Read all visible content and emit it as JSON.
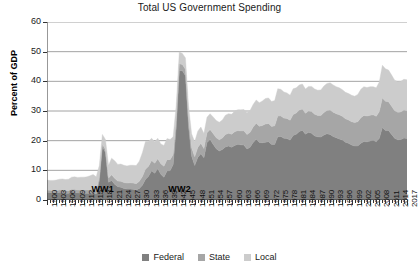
{
  "chart_data": {
    "type": "area",
    "stacked": true,
    "title": "Total US Government Spending",
    "xlabel": "",
    "ylabel": "Percent of GDP",
    "ylim": [
      0,
      60
    ],
    "yticks": [
      0,
      10,
      20,
      30,
      40,
      50,
      60
    ],
    "grid": true,
    "legend_position": "bottom",
    "x_tick_step": 3,
    "xlim": [
      1900,
      2017
    ],
    "x": [
      1900,
      1901,
      1902,
      1903,
      1904,
      1905,
      1906,
      1907,
      1908,
      1909,
      1910,
      1911,
      1912,
      1913,
      1914,
      1915,
      1916,
      1917,
      1918,
      1919,
      1920,
      1921,
      1922,
      1923,
      1924,
      1925,
      1926,
      1927,
      1928,
      1929,
      1930,
      1931,
      1932,
      1933,
      1934,
      1935,
      1936,
      1937,
      1938,
      1939,
      1940,
      1941,
      1942,
      1943,
      1944,
      1945,
      1946,
      1947,
      1948,
      1949,
      1950,
      1951,
      1952,
      1953,
      1954,
      1955,
      1956,
      1957,
      1958,
      1959,
      1960,
      1961,
      1962,
      1963,
      1964,
      1965,
      1966,
      1967,
      1968,
      1969,
      1970,
      1971,
      1972,
      1973,
      1974,
      1975,
      1976,
      1977,
      1978,
      1979,
      1980,
      1981,
      1982,
      1983,
      1984,
      1985,
      1986,
      1987,
      1988,
      1989,
      1990,
      1991,
      1992,
      1993,
      1994,
      1995,
      1996,
      1997,
      1998,
      1999,
      2000,
      2001,
      2002,
      2003,
      2004,
      2005,
      2006,
      2007,
      2008,
      2009,
      2010,
      2011,
      2012,
      2013,
      2014,
      2015,
      2016,
      2017
    ],
    "xticklabels": [
      "1900",
      "1903",
      "1906",
      "1909",
      "1912",
      "1915",
      "1918",
      "1921",
      "1924",
      "1927",
      "1930",
      "1933",
      "1936",
      "1939",
      "1942",
      "1945",
      "1948",
      "1951",
      "1954",
      "1957",
      "1960",
      "1963",
      "1966",
      "1969",
      "1972",
      "1975",
      "1978",
      "1981",
      "1984",
      "1987",
      "1990",
      "1993",
      "1996",
      "1999",
      "2002",
      "2005",
      "2008",
      "2011",
      "2014",
      "2017"
    ],
    "series": [
      {
        "name": "Federal",
        "color": "#808080",
        "values": [
          2.6,
          2.5,
          2.4,
          2.4,
          2.6,
          2.5,
          2.3,
          2.3,
          2.6,
          2.6,
          2.4,
          2.4,
          2.3,
          2.3,
          2.3,
          2.4,
          2.0,
          6.5,
          18.0,
          16.0,
          6.0,
          6.6,
          5.3,
          4.5,
          4.3,
          3.9,
          3.7,
          3.7,
          3.6,
          3.4,
          3.9,
          5.0,
          6.9,
          8.0,
          9.9,
          9.0,
          10.5,
          8.7,
          7.7,
          9.8,
          9.9,
          12.0,
          24.3,
          43.6,
          43.6,
          41.9,
          24.8,
          14.8,
          11.6,
          14.3,
          15.6,
          14.2,
          19.4,
          20.4,
          18.8,
          17.3,
          16.5,
          17.0,
          17.9,
          18.2,
          17.8,
          18.4,
          18.8,
          18.6,
          18.5,
          17.2,
          17.8,
          19.4,
          20.5,
          19.4,
          19.3,
          19.5,
          19.6,
          18.7,
          18.7,
          21.3,
          21.4,
          20.8,
          20.7,
          20.2,
          21.7,
          22.2,
          23.1,
          23.5,
          22.2,
          22.8,
          22.5,
          21.6,
          21.3,
          21.2,
          21.9,
          22.3,
          22.1,
          21.4,
          21.0,
          20.6,
          20.2,
          19.5,
          19.1,
          18.5,
          18.2,
          18.2,
          19.1,
          19.7,
          19.6,
          19.9,
          20.1,
          19.6,
          20.8,
          24.4,
          23.4,
          23.4,
          22.1,
          20.8,
          20.3,
          20.4,
          20.9,
          20.7
        ]
      },
      {
        "name": "State",
        "color": "#a6a6a6",
        "values": [
          0.8,
          0.8,
          0.8,
          0.8,
          0.8,
          0.9,
          0.9,
          0.9,
          1.0,
          1.0,
          1.0,
          1.0,
          1.1,
          1.1,
          1.2,
          1.3,
          1.2,
          1.1,
          0.9,
          1.0,
          1.4,
          1.9,
          2.0,
          1.9,
          2.0,
          2.0,
          2.0,
          2.1,
          2.1,
          2.1,
          2.4,
          2.9,
          3.5,
          3.4,
          3.4,
          3.4,
          3.4,
          3.5,
          3.7,
          3.8,
          3.7,
          3.3,
          2.8,
          2.3,
          2.1,
          2.2,
          2.6,
          2.8,
          3.0,
          3.4,
          3.5,
          3.2,
          3.3,
          3.4,
          3.6,
          3.7,
          3.8,
          3.9,
          4.2,
          4.3,
          4.4,
          4.6,
          4.6,
          4.7,
          4.8,
          4.9,
          5.0,
          5.2,
          5.4,
          5.5,
          5.8,
          6.1,
          6.2,
          6.1,
          6.3,
          7.0,
          6.9,
          6.8,
          6.8,
          6.7,
          7.1,
          7.1,
          7.2,
          7.2,
          7.0,
          7.2,
          7.3,
          7.3,
          7.2,
          7.3,
          7.6,
          7.9,
          8.2,
          8.2,
          8.1,
          8.1,
          8.0,
          7.9,
          7.9,
          7.9,
          7.9,
          8.2,
          8.6,
          8.8,
          8.7,
          8.7,
          8.6,
          8.6,
          9.0,
          10.0,
          9.9,
          9.7,
          9.5,
          9.3,
          9.3,
          9.3,
          9.4,
          9.4
        ]
      },
      {
        "name": "Local",
        "color": "#cccccc",
        "values": [
          3.3,
          3.3,
          3.4,
          3.5,
          3.6,
          3.7,
          3.7,
          3.8,
          4.1,
          4.2,
          4.2,
          4.3,
          4.3,
          4.4,
          4.7,
          4.9,
          4.6,
          4.0,
          3.2,
          3.4,
          4.3,
          5.6,
          5.9,
          5.6,
          5.8,
          5.8,
          5.8,
          5.9,
          6.0,
          6.1,
          6.8,
          8.0,
          9.3,
          8.4,
          7.5,
          7.2,
          6.9,
          6.7,
          7.0,
          7.1,
          6.8,
          6.0,
          4.9,
          4.0,
          3.7,
          3.8,
          4.3,
          4.7,
          5.0,
          5.5,
          5.5,
          5.0,
          5.2,
          5.3,
          5.6,
          5.8,
          5.9,
          6.1,
          6.5,
          6.6,
          6.7,
          7.0,
          7.0,
          7.1,
          7.2,
          7.3,
          7.4,
          7.6,
          7.8,
          7.9,
          8.3,
          8.6,
          8.6,
          8.4,
          8.5,
          9.2,
          9.0,
          8.8,
          8.6,
          8.4,
          8.7,
          8.5,
          8.5,
          8.4,
          8.2,
          8.3,
          8.5,
          8.5,
          8.5,
          8.6,
          8.9,
          9.1,
          9.2,
          9.2,
          9.1,
          9.1,
          9.0,
          8.9,
          8.9,
          8.9,
          8.9,
          9.2,
          9.6,
          9.7,
          9.6,
          9.6,
          9.5,
          9.6,
          10.0,
          11.0,
          10.9,
          10.7,
          10.5,
          10.3,
          10.3,
          10.3,
          10.4,
          10.4
        ]
      }
    ],
    "annotations": [
      {
        "text": "WW1",
        "x": 1918,
        "y": 3.5
      },
      {
        "text": "WW2",
        "x": 1943,
        "y": 3.5
      }
    ]
  },
  "legend": {
    "items": [
      {
        "label": "Federal",
        "color": "#808080"
      },
      {
        "label": "State",
        "color": "#a6a6a6"
      },
      {
        "label": "Local",
        "color": "#cccccc"
      }
    ]
  }
}
